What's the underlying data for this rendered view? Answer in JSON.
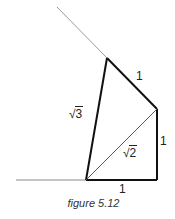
{
  "figure": {
    "caption": "figure 5.12",
    "labels": {
      "top_edge": "1",
      "right_edge": "1",
      "bottom_edge": "1",
      "diagonal": {
        "radical": "√",
        "radicand": "2"
      },
      "left_edge": {
        "radical": "√",
        "radicand": "3"
      }
    },
    "colors": {
      "construction_line": "#9a9a9a",
      "edge": "#111111",
      "diagonal": "#555555"
    }
  }
}
